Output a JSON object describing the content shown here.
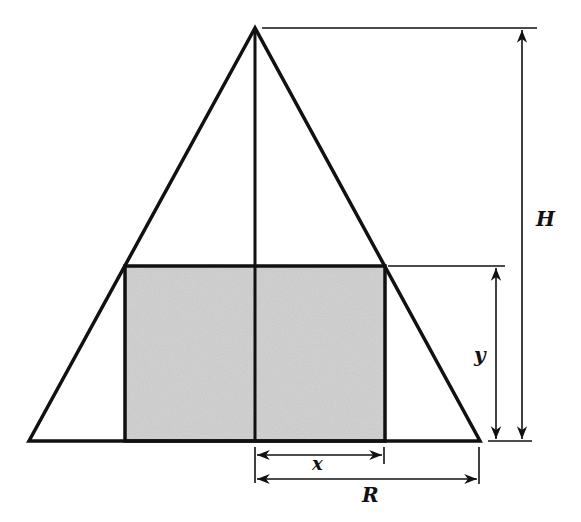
{
  "diagram": {
    "colors": {
      "stroke": "#111111",
      "fill_shaded": "#c8c8c8",
      "background": "#ffffff"
    },
    "triangle": {
      "apex": [
        255,
        28
      ],
      "base_left": [
        29,
        441
      ],
      "base_right": [
        480,
        441
      ]
    },
    "rectangle": {
      "left": 125,
      "right": 385,
      "top": 266,
      "bottom": 441
    },
    "axis_x": 255,
    "labels": {
      "height": "H",
      "rect_height": "y",
      "half_width": "x",
      "radius": "R"
    }
  }
}
